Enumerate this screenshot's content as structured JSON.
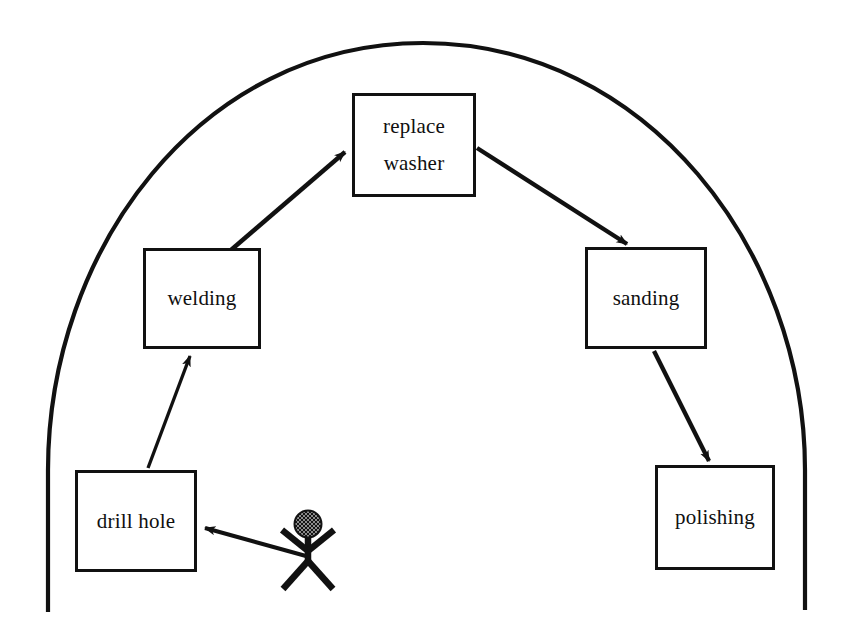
{
  "diagram": {
    "title": "Manufacturing repair activity diagram",
    "boundary": {
      "name": "system-boundary-arc",
      "shape": "arch",
      "stroke_color": "#111111"
    },
    "actor": {
      "name": "stick-figure-actor",
      "label": "",
      "head_fill": "#141414",
      "head_pattern": "crosshatch"
    },
    "nodes": [
      {
        "id": "replace-washer",
        "label_line1": "replace",
        "label_line2": "washer",
        "x": 352,
        "y": 93,
        "w": 124,
        "h": 104
      },
      {
        "id": "welding",
        "label_line1": "welding",
        "label_line2": "",
        "x": 143,
        "y": 248,
        "w": 118,
        "h": 101
      },
      {
        "id": "sanding",
        "label_line1": "sanding",
        "label_line2": "",
        "x": 585,
        "y": 247,
        "w": 122,
        "h": 102
      },
      {
        "id": "drill-hole",
        "label_line1": "drill hole",
        "label_line2": "",
        "x": 75,
        "y": 470,
        "w": 122,
        "h": 102
      },
      {
        "id": "polishing",
        "label_line1": "polishing",
        "label_line2": "",
        "x": 655,
        "y": 465,
        "w": 120,
        "h": 105
      }
    ],
    "edges": [
      {
        "id": "actor-to-drill-hole",
        "from": "actor",
        "to": "drill-hole"
      },
      {
        "id": "drill-hole-to-welding",
        "from": "drill-hole",
        "to": "welding"
      },
      {
        "id": "welding-to-replace-washer",
        "from": "welding",
        "to": "replace-washer"
      },
      {
        "id": "replace-washer-to-sanding",
        "from": "replace-washer",
        "to": "sanding"
      },
      {
        "id": "sanding-to-polishing",
        "from": "sanding",
        "to": "polishing"
      }
    ]
  }
}
